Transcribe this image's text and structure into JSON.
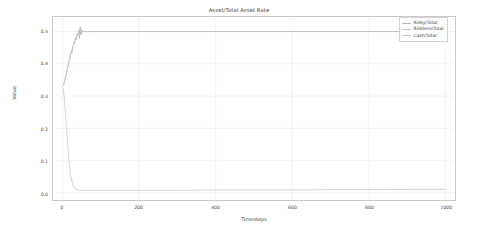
{
  "chart_data": {
    "type": "line",
    "title": "Asset/Total Asset Rate",
    "xlabel": "Timesteps",
    "ylabel": "Value",
    "xlim": [
      -25,
      1025
    ],
    "ylim": [
      -0.022,
      0.545
    ],
    "xticks": [
      0,
      200,
      400,
      600,
      800,
      1000
    ],
    "xtick_labels": [
      "0",
      "200",
      "400",
      "600",
      "800",
      "1000"
    ],
    "yticks": [
      0.0,
      0.1,
      0.2,
      0.3,
      0.4,
      0.5
    ],
    "ytick_labels": [
      "0.0",
      "0.1",
      "0.2",
      "0.3",
      "0.4",
      "0.5"
    ],
    "grid": true,
    "legend_position": "upper right",
    "series": [
      {
        "name": "Risky/Total",
        "color": "#b9b9b9",
        "x": [
          0,
          2,
          4,
          6,
          8,
          10,
          12,
          14,
          16,
          18,
          20,
          22,
          24,
          26,
          28,
          30,
          32,
          34,
          36,
          38,
          40,
          42,
          44,
          46,
          48,
          50,
          52,
          55,
          60,
          70,
          90,
          120,
          200,
          400,
          600,
          800,
          1000
        ],
        "values": [
          0.333,
          0.335,
          0.342,
          0.352,
          0.362,
          0.372,
          0.379,
          0.392,
          0.401,
          0.414,
          0.423,
          0.437,
          0.432,
          0.449,
          0.458,
          0.471,
          0.463,
          0.482,
          0.474,
          0.492,
          0.486,
          0.505,
          0.478,
          0.515,
          0.489,
          0.506,
          0.497,
          0.501,
          0.4995,
          0.4998,
          0.5,
          0.5,
          0.5,
          0.5,
          0.5,
          0.5,
          0.5
        ]
      },
      {
        "name": "Riskless/Total",
        "color": "#c4c4c4",
        "x": [
          0,
          2,
          4,
          6,
          8,
          10,
          12,
          14,
          16,
          18,
          20,
          22,
          24,
          26,
          28,
          30,
          32,
          34,
          36,
          38,
          40,
          42,
          44,
          46,
          48,
          50,
          52,
          55,
          60,
          70,
          90,
          120,
          200,
          400,
          600,
          800,
          1000
        ],
        "values": [
          0.331,
          0.334,
          0.34,
          0.349,
          0.359,
          0.369,
          0.381,
          0.389,
          0.404,
          0.411,
          0.426,
          0.433,
          0.44,
          0.446,
          0.461,
          0.467,
          0.47,
          0.478,
          0.481,
          0.488,
          0.492,
          0.498,
          0.493,
          0.51,
          0.492,
          0.503,
          0.4985,
          0.5005,
          0.4997,
          0.4999,
          0.5,
          0.5,
          0.5,
          0.5,
          0.5,
          0.5,
          0.5
        ]
      },
      {
        "name": "Cash/Total",
        "color": "#c9c9c9",
        "x": [
          0,
          2,
          4,
          6,
          8,
          10,
          12,
          14,
          16,
          18,
          20,
          22,
          24,
          26,
          28,
          30,
          32,
          35,
          40,
          45,
          50,
          60,
          80,
          120,
          200,
          300,
          400,
          500,
          600,
          700,
          800,
          900,
          1000
        ],
        "values": [
          0.33,
          0.32,
          0.3,
          0.272,
          0.24,
          0.205,
          0.17,
          0.138,
          0.11,
          0.086,
          0.066,
          0.05,
          0.038,
          0.029,
          0.022,
          0.017,
          0.014,
          0.011,
          0.009,
          0.008,
          0.008,
          0.008,
          0.008,
          0.008,
          0.008,
          0.008,
          0.009,
          0.009,
          0.009,
          0.01,
          0.01,
          0.011,
          0.011
        ]
      }
    ]
  }
}
